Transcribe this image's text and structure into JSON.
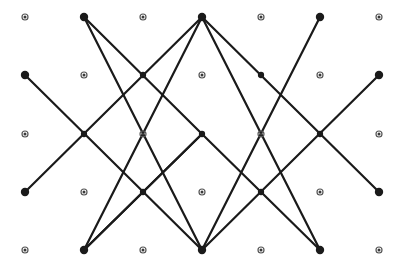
{
  "figure": {
    "width": 404,
    "height": 267,
    "background_color": "#ffffff",
    "line_color": "#1a1a1a",
    "line_width": 2.2,
    "node_filled_color": "#1a1a1a",
    "node_filled_radius": 4.2,
    "node_small_ring_color": "#555555",
    "node_small_fill_color": "#3a3a3a",
    "node_small_outer_radius": 3.0,
    "node_small_inner_radius": 1.5
  },
  "grid": {
    "columns": 7,
    "rows": 5,
    "column_x": [
      25,
      84,
      143,
      202,
      261,
      320,
      379
    ],
    "row_y": [
      17,
      75,
      134,
      192,
      250
    ],
    "column_spacing": 59,
    "row_spacing": 58
  },
  "chart_data": {
    "type": "scatter",
    "xlabel": "",
    "ylabel": "",
    "xlim": [
      0,
      404
    ],
    "ylim": [
      0,
      267
    ],
    "grid": false,
    "legend": "none",
    "x": [
      25,
      84,
      143,
      202,
      261,
      320,
      379,
      25,
      84,
      143,
      202,
      261,
      320,
      379,
      25,
      84,
      143,
      202,
      261,
      320,
      379,
      25,
      84,
      143,
      202,
      261,
      320,
      379,
      25,
      84,
      143,
      202,
      261,
      320,
      379
    ],
    "y": [
      17,
      17,
      17,
      17,
      17,
      17,
      17,
      75,
      75,
      75,
      75,
      75,
      75,
      75,
      134,
      134,
      134,
      134,
      134,
      134,
      134,
      192,
      192,
      192,
      192,
      192,
      192,
      192,
      250,
      250,
      250,
      250,
      250,
      250,
      250
    ],
    "node_styles": [
      "small",
      "filled",
      "small",
      "filled",
      "small",
      "filled",
      "small",
      "filled",
      "small",
      "filled",
      "small",
      "filled",
      "small",
      "filled",
      "small",
      "filled",
      "small",
      "filled",
      "small",
      "filled",
      "small",
      "filled",
      "small",
      "filled",
      "small",
      "filled",
      "small",
      "filled",
      "small",
      "filled",
      "small",
      "filled",
      "small",
      "filled",
      "small"
    ],
    "polylines": [
      {
        "name": "zigzag-left-descending",
        "points": [
          [
            84,
            17
          ],
          [
            202,
            134
          ],
          [
            84,
            250
          ]
        ]
      },
      {
        "name": "zigzag-center-peak",
        "points": [
          [
            84,
            250
          ],
          [
            202,
            134
          ],
          [
            320,
            250
          ]
        ]
      },
      {
        "name": "zigzag-top-center-peak",
        "points": [
          [
            84,
            250
          ],
          [
            202,
            17
          ],
          [
            320,
            250
          ]
        ]
      },
      {
        "name": "zigzag-bottom-center-valley",
        "points": [
          [
            84,
            17
          ],
          [
            202,
            250
          ],
          [
            320,
            17
          ]
        ]
      },
      {
        "name": "left-edge-diagonal-up",
        "points": [
          [
            25,
            75
          ],
          [
            202,
            250
          ]
        ]
      },
      {
        "name": "right-edge-diagonal-up",
        "points": [
          [
            379,
            75
          ],
          [
            202,
            250
          ]
        ]
      },
      {
        "name": "left-edge-diagonal-down",
        "points": [
          [
            25,
            192
          ],
          [
            202,
            17
          ]
        ]
      },
      {
        "name": "right-edge-diagonal-down",
        "points": [
          [
            379,
            192
          ],
          [
            202,
            17
          ]
        ]
      }
    ],
    "endpoints": [
      {
        "label": "top-left-node",
        "x": 84,
        "y": 17
      },
      {
        "label": "top-apex-node",
        "x": 202,
        "y": 17
      },
      {
        "label": "top-right-node",
        "x": 320,
        "y": 17
      },
      {
        "label": "left-upper-node",
        "x": 25,
        "y": 75
      },
      {
        "label": "right-upper-node",
        "x": 379,
        "y": 75
      },
      {
        "label": "left-lower-node",
        "x": 25,
        "y": 192
      },
      {
        "label": "right-lower-node",
        "x": 379,
        "y": 192
      },
      {
        "label": "bottom-left-node",
        "x": 84,
        "y": 250
      },
      {
        "label": "bottom-valley-node",
        "x": 202,
        "y": 250
      },
      {
        "label": "bottom-right-node",
        "x": 320,
        "y": 250
      }
    ],
    "crossings": [
      {
        "label": "crossing-r2c3",
        "x": 143,
        "y": 75
      },
      {
        "label": "crossing-r2c5",
        "x": 261,
        "y": 75
      },
      {
        "label": "crossing-r3c2",
        "x": 84,
        "y": 134
      },
      {
        "label": "crossing-r3c4",
        "x": 202,
        "y": 134
      },
      {
        "label": "crossing-r3c6",
        "x": 320,
        "y": 134
      },
      {
        "label": "crossing-r4c3",
        "x": 143,
        "y": 192
      },
      {
        "label": "crossing-r4c5",
        "x": 261,
        "y": 192
      }
    ],
    "small_dots": [
      {
        "x": 25,
        "y": 17
      },
      {
        "x": 143,
        "y": 17
      },
      {
        "x": 261,
        "y": 17
      },
      {
        "x": 379,
        "y": 17
      },
      {
        "x": 84,
        "y": 75
      },
      {
        "x": 202,
        "y": 75
      },
      {
        "x": 320,
        "y": 75
      },
      {
        "x": 25,
        "y": 134
      },
      {
        "x": 143,
        "y": 134
      },
      {
        "x": 261,
        "y": 134
      },
      {
        "x": 379,
        "y": 134
      },
      {
        "x": 84,
        "y": 192
      },
      {
        "x": 202,
        "y": 192
      },
      {
        "x": 320,
        "y": 192
      },
      {
        "x": 25,
        "y": 250
      },
      {
        "x": 143,
        "y": 250
      },
      {
        "x": 261,
        "y": 250
      },
      {
        "x": 379,
        "y": 250
      }
    ]
  }
}
